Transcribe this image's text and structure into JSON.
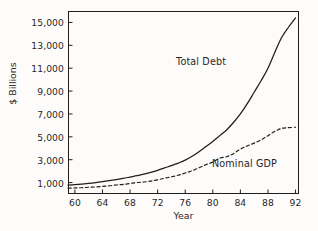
{
  "figure": {
    "background_color": "#fdfcfb",
    "frame_color": "#201d1c"
  },
  "chart_data": {
    "type": "line",
    "title": "",
    "xlabel": "Year",
    "ylabel": "$ Billions",
    "xlim": [
      59,
      92.5
    ],
    "ylim": [
      0,
      16000
    ],
    "grid": false,
    "legend_position": "inline-annotation",
    "xticks": [
      "60",
      "64",
      "68",
      "72",
      "76",
      "80",
      "84",
      "88",
      "92"
    ],
    "xtick_values": [
      60,
      64,
      68,
      72,
      76,
      80,
      84,
      88,
      92
    ],
    "yticks": [
      "1,000",
      "3,000",
      "5,000",
      "7,000",
      "9,000",
      "11,000",
      "13,000",
      "15,000"
    ],
    "ytick_values": [
      1000,
      3000,
      5000,
      7000,
      9000,
      11000,
      13000,
      15000
    ],
    "x": [
      59,
      60,
      61,
      62,
      63,
      64,
      65,
      66,
      67,
      68,
      69,
      70,
      71,
      72,
      73,
      74,
      75,
      76,
      77,
      78,
      79,
      80,
      81,
      82,
      83,
      84,
      85,
      86,
      87,
      88,
      89,
      90,
      91,
      92
    ],
    "series": [
      {
        "name": "Total Debt",
        "style": "solid",
        "color": "#201d1c",
        "values": [
          780,
          820,
          870,
          930,
          1000,
          1080,
          1170,
          1260,
          1360,
          1480,
          1600,
          1730,
          1890,
          2070,
          2280,
          2480,
          2700,
          2960,
          3300,
          3700,
          4150,
          4600,
          5100,
          5600,
          6250,
          7000,
          7900,
          8900,
          9900,
          11000,
          12400,
          13700,
          14600,
          15400
        ]
      },
      {
        "name": "Nominal GDP",
        "style": "dashed",
        "color": "#201d1c",
        "values": [
          510,
          530,
          550,
          590,
          620,
          670,
          720,
          790,
          840,
          920,
          1000,
          1050,
          1130,
          1240,
          1380,
          1500,
          1640,
          1830,
          2030,
          2290,
          2560,
          2790,
          3130,
          3260,
          3530,
          3930,
          4210,
          4450,
          4740,
          5100,
          5480,
          5740,
          5800,
          5840
        ]
      }
    ],
    "annotations": [
      {
        "text": "Total Debt",
        "series": "Total Debt"
      },
      {
        "text": "Nominal GDP",
        "series": "Nominal GDP"
      }
    ]
  }
}
